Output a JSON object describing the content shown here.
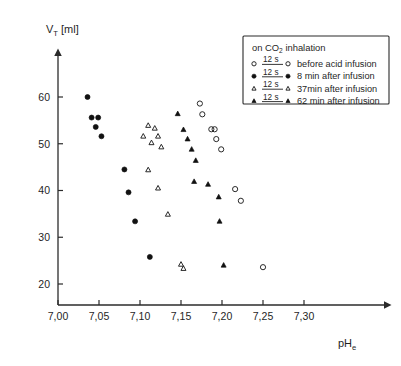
{
  "chart_data": {
    "type": "scatter",
    "title": "",
    "xlabel": "pH e",
    "ylabel": "V T [ml]",
    "xlim": [
      6.985,
      7.325
    ],
    "ylim": [
      18.5,
      63.5
    ],
    "grid": false,
    "legend_position": "top-right",
    "x_ticks": [
      "7,00",
      "7,05",
      "7,10",
      "7,15",
      "7,20",
      "7,25",
      "7,30"
    ],
    "x_tick_values": [
      7.0,
      7.05,
      7.1,
      7.15,
      7.2,
      7.25,
      7.3
    ],
    "y_ticks": [
      "60",
      "50",
      "40",
      "30",
      "20"
    ],
    "y_tick_values": [
      60,
      50,
      40,
      30,
      20
    ],
    "series": [
      {
        "name": "before acid infusion",
        "marker": "open-circle",
        "duration": "12 s",
        "points": [
          [
            7.173,
            58.6
          ],
          [
            7.176,
            56.3
          ],
          [
            7.187,
            53.1
          ],
          [
            7.191,
            53.1
          ],
          [
            7.193,
            51.0
          ],
          [
            7.199,
            48.8
          ],
          [
            7.216,
            40.3
          ],
          [
            7.223,
            37.8
          ],
          [
            7.25,
            23.6
          ]
        ]
      },
      {
        "name": "8 min after infusion",
        "marker": "filled-circle",
        "duration": "12 s",
        "points": [
          [
            7.036,
            60.0
          ],
          [
            7.041,
            55.6
          ],
          [
            7.049,
            55.6
          ],
          [
            7.046,
            53.6
          ],
          [
            7.053,
            51.6
          ],
          [
            7.081,
            44.5
          ],
          [
            7.086,
            39.6
          ],
          [
            7.094,
            33.4
          ],
          [
            7.112,
            25.8
          ]
        ]
      },
      {
        "name": "37min after infusion",
        "marker": "open-triangle",
        "duration": "12 s",
        "points": [
          [
            7.11,
            53.9
          ],
          [
            7.118,
            53.3
          ],
          [
            7.104,
            51.6
          ],
          [
            7.122,
            51.6
          ],
          [
            7.114,
            50.2
          ],
          [
            7.126,
            49.3
          ],
          [
            7.11,
            44.4
          ],
          [
            7.122,
            40.5
          ],
          [
            7.134,
            34.9
          ],
          [
            7.15,
            24.2
          ],
          [
            7.153,
            23.3
          ]
        ]
      },
      {
        "name": "62 min after infusion",
        "marker": "filled-triangle",
        "duration": "12 s",
        "points": [
          [
            7.146,
            56.4
          ],
          [
            7.153,
            53.0
          ],
          [
            7.158,
            51.0
          ],
          [
            7.163,
            48.8
          ],
          [
            7.168,
            46.4
          ],
          [
            7.166,
            41.9
          ],
          [
            7.183,
            41.3
          ],
          [
            7.196,
            38.6
          ],
          [
            7.197,
            33.4
          ],
          [
            7.202,
            24.0
          ]
        ]
      }
    ]
  },
  "axes": {
    "y_label_main": "V",
    "y_label_sub": "T",
    "y_label_unit": "[ml]",
    "x_label_main": "pH",
    "x_label_sub": "e"
  },
  "legend": {
    "header": "on CO",
    "header_sub": "2",
    "header_tail": " inhalation",
    "rows": [
      {
        "duration": "12 s",
        "label": "before acid infusion",
        "marker": "open-circle"
      },
      {
        "duration": "12 s",
        "label": "8 min after infusion",
        "marker": "filled-circle"
      },
      {
        "duration": "12 s",
        "label": "37min after infusion",
        "marker": "open-triangle"
      },
      {
        "duration": "12 s",
        "label": "62 min after infusion",
        "marker": "filled-triangle"
      }
    ]
  },
  "colors": {
    "ink": "#1f1f1f",
    "marker_fill": "#111111",
    "background": "#ffffff"
  }
}
